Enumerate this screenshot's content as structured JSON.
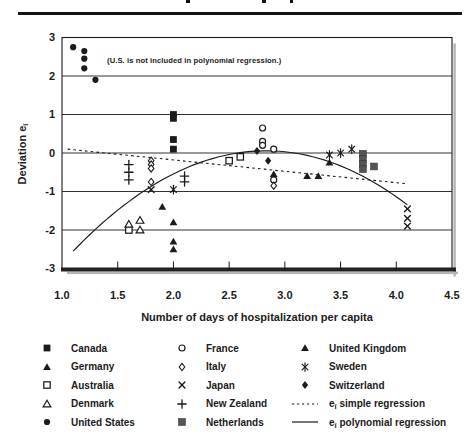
{
  "figure": {
    "note": "(U.S. is not included in polynomial regression.)",
    "y_axis": {
      "title_main": "Deviation e",
      "title_sub": "î",
      "ticks": [
        {
          "label": "3",
          "value": 3
        },
        {
          "label": "2",
          "value": 2
        },
        {
          "label": "1",
          "value": 1
        },
        {
          "label": "0",
          "value": 0
        },
        {
          "label": "-1",
          "value": -1
        },
        {
          "label": "-2",
          "value": -2
        },
        {
          "label": "-3",
          "value": -3
        }
      ]
    },
    "x_axis": {
      "title": "Number of days of hospitalization per capita",
      "ticks": [
        {
          "label": "1.0",
          "value": 1.0
        },
        {
          "label": "1.5",
          "value": 1.5
        },
        {
          "label": "2.0",
          "value": 2.0
        },
        {
          "label": "2.5",
          "value": 2.5
        },
        {
          "label": "3.0",
          "value": 3.0
        },
        {
          "label": "3.5",
          "value": 3.5
        },
        {
          "label": "4.0",
          "value": 4.0
        },
        {
          "label": "4.5",
          "value": 4.5
        }
      ]
    }
  },
  "chart_data": {
    "type": "scatter",
    "title": "",
    "xlabel": "Number of days of hospitalization per capita",
    "ylabel": "Deviation e-hat-i",
    "xlim": [
      1.0,
      4.5
    ],
    "ylim": [
      -3,
      3
    ],
    "grid": "horizontal",
    "annotation": "(U.S. is not included in polynomial regression.)",
    "series": [
      {
        "name": "Canada",
        "marker": "filled-square",
        "points": [
          [
            2.0,
            1.0
          ],
          [
            2.0,
            0.9
          ],
          [
            2.0,
            0.35
          ],
          [
            2.0,
            0.1
          ]
        ]
      },
      {
        "name": "Germany",
        "marker": "filled-triangle",
        "points": [
          [
            2.9,
            -0.55
          ],
          [
            3.2,
            -0.6
          ],
          [
            3.3,
            -0.6
          ],
          [
            3.4,
            -0.25
          ]
        ]
      },
      {
        "name": "Australia",
        "marker": "open-square",
        "points": [
          [
            1.6,
            -2.0
          ],
          [
            2.5,
            -0.2
          ],
          [
            2.6,
            -0.1
          ]
        ]
      },
      {
        "name": "Denmark",
        "marker": "open-triangle",
        "points": [
          [
            1.6,
            -1.85
          ],
          [
            1.7,
            -1.75
          ],
          [
            1.7,
            -2.0
          ]
        ]
      },
      {
        "name": "United States",
        "marker": "filled-circle",
        "points": [
          [
            1.1,
            2.75
          ],
          [
            1.2,
            2.65
          ],
          [
            1.2,
            2.45
          ],
          [
            1.2,
            2.2
          ],
          [
            1.3,
            1.9
          ]
        ]
      },
      {
        "name": "France",
        "marker": "open-circle",
        "points": [
          [
            2.8,
            0.65
          ],
          [
            2.8,
            0.3
          ],
          [
            2.8,
            0.2
          ],
          [
            2.9,
            0.1
          ],
          [
            2.9,
            -0.7
          ]
        ]
      },
      {
        "name": "Italy",
        "marker": "open-diamond",
        "points": [
          [
            1.8,
            -0.2
          ],
          [
            1.8,
            -0.3
          ],
          [
            1.8,
            -0.4
          ],
          [
            1.8,
            -0.75
          ],
          [
            2.9,
            -0.85
          ]
        ]
      },
      {
        "name": "Japan",
        "marker": "x-cross",
        "points": [
          [
            1.8,
            -0.95
          ],
          [
            4.1,
            -1.45
          ],
          [
            4.1,
            -1.7
          ],
          [
            4.1,
            -1.9
          ]
        ]
      },
      {
        "name": "New Zealand",
        "marker": "plus",
        "points": [
          [
            1.6,
            -0.3
          ],
          [
            1.6,
            -0.5
          ],
          [
            1.6,
            -0.7
          ],
          [
            2.1,
            -0.6
          ],
          [
            2.1,
            -0.75
          ]
        ]
      },
      {
        "name": "Netherlands",
        "marker": "gray-square",
        "points": [
          [
            3.7,
            -0.02
          ],
          [
            3.7,
            -0.15
          ],
          [
            3.7,
            -0.28
          ],
          [
            3.7,
            -0.42
          ],
          [
            3.8,
            -0.35
          ]
        ]
      },
      {
        "name": "United Kingdom",
        "marker": "filled-triangle",
        "points": [
          [
            1.9,
            -1.4
          ],
          [
            2.0,
            -1.8
          ],
          [
            2.0,
            -2.3
          ],
          [
            2.0,
            -2.5
          ]
        ]
      },
      {
        "name": "Sweden",
        "marker": "star",
        "points": [
          [
            2.0,
            -0.95
          ],
          [
            3.4,
            -0.05
          ],
          [
            3.5,
            0.0
          ],
          [
            3.6,
            0.1
          ]
        ]
      },
      {
        "name": "Switzerland",
        "marker": "filled-diamond",
        "points": [
          [
            2.75,
            0.05
          ],
          [
            2.85,
            -0.2
          ]
        ]
      }
    ],
    "lines": [
      {
        "name": "e-hat-i simple regression",
        "style": "dotted",
        "endpoints": [
          [
            1.05,
            0.1
          ],
          [
            4.1,
            -0.8
          ]
        ]
      },
      {
        "name": "e-hat-i polynomial regression",
        "style": "solid",
        "quadratic": {
          "a": -0.8709,
          "b": 4.929,
          "c": -6.918
        },
        "domain": [
          1.1,
          4.1
        ]
      }
    ]
  },
  "legend": {
    "columns": [
      [
        {
          "key": "canada",
          "marker": "filled-square",
          "parts": [
            {
              "text": "Canada"
            }
          ]
        },
        {
          "key": "germany",
          "marker": "filled-triangle",
          "parts": [
            {
              "text": "Germany"
            }
          ]
        },
        {
          "key": "australia",
          "marker": "open-square",
          "parts": [
            {
              "text": "Australia"
            }
          ]
        },
        {
          "key": "denmark",
          "marker": "open-triangle",
          "parts": [
            {
              "text": "Denmark"
            }
          ]
        },
        {
          "key": "united-states",
          "marker": "filled-circle",
          "parts": [
            {
              "text": "United States"
            }
          ]
        }
      ],
      [
        {
          "key": "france",
          "marker": "open-circle",
          "parts": [
            {
              "text": "France"
            }
          ]
        },
        {
          "key": "italy",
          "marker": "open-diamond",
          "parts": [
            {
              "text": "Italy"
            }
          ]
        },
        {
          "key": "japan",
          "marker": "x-cross",
          "parts": [
            {
              "text": "Japan"
            }
          ]
        },
        {
          "key": "new-zealand",
          "marker": "plus",
          "parts": [
            {
              "text": "New Zealand"
            }
          ]
        },
        {
          "key": "netherlands",
          "marker": "gray-square",
          "parts": [
            {
              "text": "Netherlands"
            }
          ]
        }
      ],
      [
        {
          "key": "united-kingdom",
          "marker": "filled-triangle",
          "parts": [
            {
              "text": "United Kingdom"
            }
          ]
        },
        {
          "key": "sweden",
          "marker": "star",
          "parts": [
            {
              "text": "Sweden"
            }
          ]
        },
        {
          "key": "switzerland",
          "marker": "filled-diamond",
          "parts": [
            {
              "text": "Switzerland"
            }
          ]
        },
        {
          "key": "simple-regression",
          "marker": "dotted-line",
          "parts": [
            {
              "text": "e"
            },
            {
              "text": "î",
              "sub": true
            },
            {
              "text": " simple regression"
            }
          ]
        },
        {
          "key": "polynomial-regression",
          "marker": "solid-line",
          "parts": [
            {
              "text": "e"
            },
            {
              "text": "î",
              "sub": true
            },
            {
              "text": " polynomial regression"
            }
          ]
        }
      ]
    ]
  },
  "colors": {
    "ink": "#1b1b1b",
    "netherlands_gray": "#545454",
    "shadow": "#b5b5b5",
    "background": "#ffffff"
  }
}
